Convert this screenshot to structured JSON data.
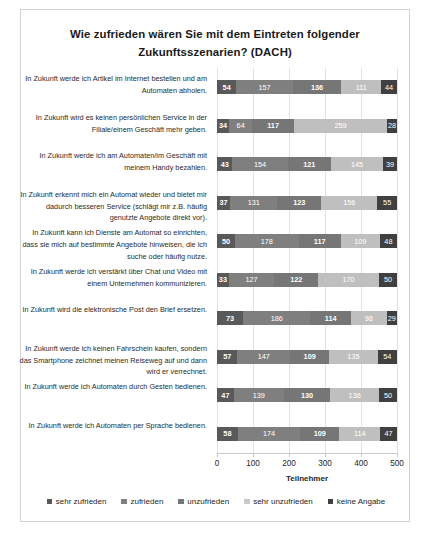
{
  "chart_data": {
    "type": "bar",
    "orientation": "horizontal",
    "stacked": true,
    "title": "Wie zufrieden wären Sie mit dem Eintreten folgender Zukunftsszenarien? (DACH)",
    "title_line1": "Wie zufrieden wären Sie mit dem Eintreten folgender",
    "title_line2": "Zukunftsszenarien? (DACH)",
    "xlabel": "Teilnehmer",
    "ylabel": "",
    "xlim": [
      0,
      500
    ],
    "xticks": [
      0,
      100,
      200,
      300,
      400,
      500
    ],
    "xtick_labels": [
      "0",
      "100",
      "200",
      "300",
      "400",
      "500"
    ],
    "grid": true,
    "legend_position": "bottom",
    "legend": [
      "sehr zufrieden",
      "zufrieden",
      "unzufrieden",
      "sehr unzufrieden",
      "keine Angabe"
    ],
    "colors": [
      "#595959",
      "#7f7f7f",
      "#767676",
      "#bfbfbf",
      "#404040"
    ],
    "categories": [
      "In Zukunft werde ich Artikel im Internet bestellen und am Automaten abholen.",
      "In Zukunft wird es keinen persönlichen Service in der Filiale/einem Geschäft mehr geben.",
      "In Zukunft werde ich am Automaten/im Geschäft mit meinem Handy bezahlen.",
      "In Zukunft erkennt mich ein Automat wieder und bietet mir dadurch besseren Service (schlägt mir z.B. häufig genutzte Angebote direkt vor).",
      "In Zukunft kann ich Dienste am Automat so einrichten, dass sie mich auf bestimmte Angebote hinweisen, die ich suche oder häufig nutze.",
      "In Zukunft werde ich verstärkt über Chat und Video mit einem Unternehmen kommunizieren.",
      "In Zukunft wird die elektronische Post den Brief ersetzen.",
      "In Zukunft werde ich keinen Fahrschein kaufen, sondern das Smartphone zeichnet meinen Reiseweg auf und dann wird er verrechnet.",
      "In Zukunft werde ich Automaten durch Gesten bedienen.",
      "In Zukunft werde ich Automaten per Sprache bedienen."
    ],
    "series": [
      {
        "name": "sehr zufrieden",
        "values": [
          54,
          34,
          43,
          37,
          50,
          33,
          73,
          57,
          47,
          58
        ]
      },
      {
        "name": "zufrieden",
        "values": [
          157,
          64,
          154,
          131,
          178,
          127,
          186,
          147,
          139,
          174
        ]
      },
      {
        "name": "unzufrieden",
        "values": [
          136,
          117,
          121,
          123,
          117,
          122,
          114,
          109,
          130,
          109
        ]
      },
      {
        "name": "sehr unzufrieden",
        "values": [
          111,
          259,
          145,
          156,
          109,
          170,
          98,
          135,
          136,
          114
        ]
      },
      {
        "name": "keine Angabe",
        "values": [
          44,
          28,
          39,
          55,
          48,
          50,
          29,
          54,
          50,
          47
        ]
      }
    ]
  }
}
